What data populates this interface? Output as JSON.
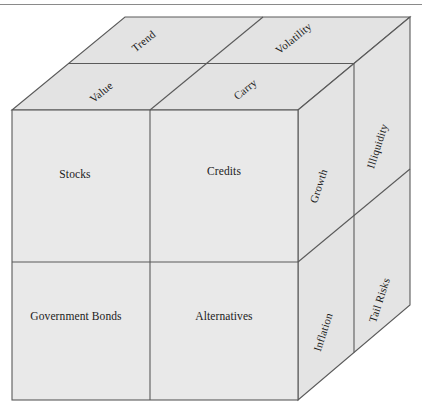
{
  "figure": {
    "title": "",
    "type": "three-dimensional-cube-diagram",
    "divider_rule": "horizontal-rule"
  },
  "colors": {
    "front_face": "#e9e9e9",
    "top_face": "#e3e3e3",
    "right_face": "#e4e4e4",
    "edge_stroke": "#5a5a5a",
    "text": "#1b1b1b",
    "rule": "#8a8a8a",
    "page_background": "#ffffff"
  },
  "cube": {
    "front_face": {
      "name": "asset-classes",
      "cells": [
        {
          "id": "stocks",
          "label": "Stocks",
          "row": 0,
          "col": 0
        },
        {
          "id": "credits",
          "label": "Credits",
          "row": 0,
          "col": 1
        },
        {
          "id": "government-bonds",
          "label": "Government Bonds",
          "row": 1,
          "col": 0
        },
        {
          "id": "alternatives",
          "label": "Alternatives",
          "row": 1,
          "col": 1
        }
      ]
    },
    "top_face": {
      "name": "styles",
      "cells": [
        {
          "id": "trend",
          "label": "Trend",
          "row": 0,
          "col": 0
        },
        {
          "id": "volatility",
          "label": "Volatility",
          "row": 0,
          "col": 1
        },
        {
          "id": "value",
          "label": "Value",
          "row": 1,
          "col": 0
        },
        {
          "id": "carry",
          "label": "Carry",
          "row": 1,
          "col": 1
        }
      ]
    },
    "right_face": {
      "name": "risk-factors",
      "cells": [
        {
          "id": "growth",
          "label": "Growth",
          "row": 0,
          "col": 0
        },
        {
          "id": "illiquidity",
          "label": "Illiquidity",
          "row": 0,
          "col": 1
        },
        {
          "id": "inflation",
          "label": "Inflation",
          "row": 1,
          "col": 0
        },
        {
          "id": "tail-risks",
          "label": "Tail Risks",
          "row": 1,
          "col": 1
        }
      ]
    }
  }
}
